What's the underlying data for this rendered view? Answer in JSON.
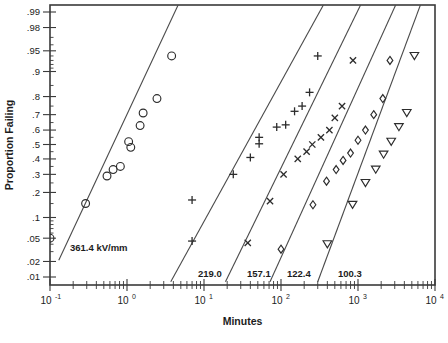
{
  "chart_data": {
    "type": "scatter",
    "title": "",
    "xlabel": "Minutes",
    "ylabel": "Proportion Failing",
    "xscale": "log",
    "yscale": "probability-lognormal",
    "grid": false,
    "legend_position": "inline-annotation",
    "xlim": [
      0.1,
      10000
    ],
    "ylim": [
      0.01,
      0.99
    ],
    "x_tick_labels": [
      "10",
      "10",
      "10",
      "10",
      "10",
      "10"
    ],
    "x_tick_exponents": [
      "-1",
      "0",
      "1",
      "2",
      "3",
      "4"
    ],
    "x_tick_values": [
      0.1,
      1,
      10,
      100,
      1000,
      10000
    ],
    "y_tick_labels": [
      ".99",
      ".98",
      ".95",
      ".9",
      ".8",
      ".7",
      ".6",
      ".5",
      ".4",
      ".3",
      ".2",
      ".1",
      ".05",
      ".02",
      ".01"
    ],
    "y_tick_values": [
      0.99,
      0.98,
      0.95,
      0.9,
      0.8,
      0.7,
      0.6,
      0.5,
      0.4,
      0.3,
      0.2,
      0.1,
      0.05,
      0.02,
      0.01
    ],
    "series": [
      {
        "name": "361.4 kV/mm",
        "label": "361.4 kV/mm",
        "marker": "circle",
        "points": [
          {
            "x": 0.1,
            "y": 0.05
          },
          {
            "x": 0.29,
            "y": 0.15
          },
          {
            "x": 0.55,
            "y": 0.29
          },
          {
            "x": 0.66,
            "y": 0.33
          },
          {
            "x": 0.82,
            "y": 0.35
          },
          {
            "x": 1.05,
            "y": 0.52
          },
          {
            "x": 1.12,
            "y": 0.48
          },
          {
            "x": 1.48,
            "y": 0.63
          },
          {
            "x": 1.62,
            "y": 0.71
          },
          {
            "x": 2.45,
            "y": 0.79
          },
          {
            "x": 3.8,
            "y": 0.94
          }
        ],
        "fit_line": {
          "x1": 0.13,
          "y1": 0.021,
          "x2": 5.1,
          "y2": 0.995
        }
      },
      {
        "name": "219.0",
        "label": "219.0",
        "marker": "plus",
        "points": [
          {
            "x": 7.0,
            "y": 0.045
          },
          {
            "x": 7.0,
            "y": 0.165
          },
          {
            "x": 24.0,
            "y": 0.3
          },
          {
            "x": 40.0,
            "y": 0.41
          },
          {
            "x": 52.0,
            "y": 0.505
          },
          {
            "x": 52.0,
            "y": 0.55
          },
          {
            "x": 88.0,
            "y": 0.62
          },
          {
            "x": 115.0,
            "y": 0.635
          },
          {
            "x": 150.0,
            "y": 0.72
          },
          {
            "x": 188.0,
            "y": 0.75
          },
          {
            "x": 235.0,
            "y": 0.82
          },
          {
            "x": 300.0,
            "y": 0.94
          }
        ],
        "fit_line": {
          "x1": 3.7,
          "y1": 0.008,
          "x2": 400.0,
          "y2": 0.995
        }
      },
      {
        "name": "157.1",
        "label": "157.1",
        "marker": "cross",
        "points": [
          {
            "x": 37.0,
            "y": 0.042
          },
          {
            "x": 72.0,
            "y": 0.16
          },
          {
            "x": 108.0,
            "y": 0.3
          },
          {
            "x": 165.0,
            "y": 0.4
          },
          {
            "x": 215.0,
            "y": 0.45
          },
          {
            "x": 255.0,
            "y": 0.5
          },
          {
            "x": 330.0,
            "y": 0.55
          },
          {
            "x": 425.0,
            "y": 0.6
          },
          {
            "x": 500.0,
            "y": 0.68
          },
          {
            "x": 620.0,
            "y": 0.75
          },
          {
            "x": 860.0,
            "y": 0.93
          }
        ],
        "fit_line": {
          "x1": 19.0,
          "y1": 0.008,
          "x2": 1200.0,
          "y2": 0.995
        }
      },
      {
        "name": "122.4",
        "label": "122.4",
        "marker": "diamond",
        "points": [
          {
            "x": 100.0,
            "y": 0.033
          },
          {
            "x": 260.0,
            "y": 0.145
          },
          {
            "x": 390.0,
            "y": 0.26
          },
          {
            "x": 520.0,
            "y": 0.33
          },
          {
            "x": 640.0,
            "y": 0.39
          },
          {
            "x": 800.0,
            "y": 0.44
          },
          {
            "x": 1000.0,
            "y": 0.53
          },
          {
            "x": 1250.0,
            "y": 0.6
          },
          {
            "x": 1600.0,
            "y": 0.7
          },
          {
            "x": 2100.0,
            "y": 0.79
          },
          {
            "x": 2600.0,
            "y": 0.93
          }
        ],
        "fit_line": {
          "x1": 72.0,
          "y1": 0.008,
          "x2": 3400.0,
          "y2": 0.995
        }
      },
      {
        "name": "100.3",
        "label": "100.3",
        "marker": "triangle-down",
        "points": [
          {
            "x": 400.0,
            "y": 0.04
          },
          {
            "x": 850.0,
            "y": 0.145
          },
          {
            "x": 1250.0,
            "y": 0.25
          },
          {
            "x": 1700.0,
            "y": 0.33
          },
          {
            "x": 2150.0,
            "y": 0.43
          },
          {
            "x": 2700.0,
            "y": 0.52
          },
          {
            "x": 3400.0,
            "y": 0.62
          },
          {
            "x": 4300.0,
            "y": 0.71
          },
          {
            "x": 5400.0,
            "y": 0.94
          }
        ],
        "fit_line": {
          "x1": 300.0,
          "y1": 0.008,
          "x2": 7000.0,
          "y2": 0.995
        }
      }
    ]
  },
  "axes": {
    "x_title": "Minutes",
    "y_title": "Proportion Failing"
  },
  "colors": {
    "axis": "#3a3a3a",
    "marker": "#2c2c2c",
    "line": "#4a4a4a",
    "background": "#ffffff"
  }
}
